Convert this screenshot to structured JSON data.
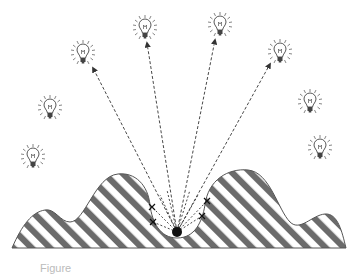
{
  "figure": {
    "caption": "Figure",
    "colors": {
      "stripe": "#6b6b6b",
      "outline": "#555555",
      "line": "#333333",
      "dot": "#111111",
      "bulb": "#555555"
    },
    "source_dot": {
      "x": 177,
      "y": 232,
      "r": 5
    },
    "bulbs": [
      {
        "x": 83,
        "y": 53
      },
      {
        "x": 145,
        "y": 28
      },
      {
        "x": 220,
        "y": 25
      },
      {
        "x": 280,
        "y": 52
      },
      {
        "x": 50,
        "y": 108
      },
      {
        "x": 310,
        "y": 102
      },
      {
        "x": 33,
        "y": 157
      },
      {
        "x": 320,
        "y": 148
      }
    ],
    "arrows": [
      {
        "x2": 93,
        "y2": 68
      },
      {
        "x2": 147,
        "y2": 43
      },
      {
        "x2": 215,
        "y2": 40
      },
      {
        "x2": 270,
        "y2": 64
      }
    ],
    "blocked_rays": [
      {
        "x2": 152,
        "y2": 207,
        "mark": true
      },
      {
        "x2": 153,
        "y2": 222,
        "mark": true
      },
      {
        "x2": 207,
        "y2": 201,
        "mark": true
      },
      {
        "x2": 202,
        "y2": 216,
        "mark": true
      },
      {
        "x2": 160,
        "y2": 195,
        "mark": false
      },
      {
        "x2": 167,
        "y2": 190,
        "mark": false
      },
      {
        "x2": 190,
        "y2": 190,
        "mark": false
      },
      {
        "x2": 198,
        "y2": 195,
        "mark": false
      }
    ]
  }
}
